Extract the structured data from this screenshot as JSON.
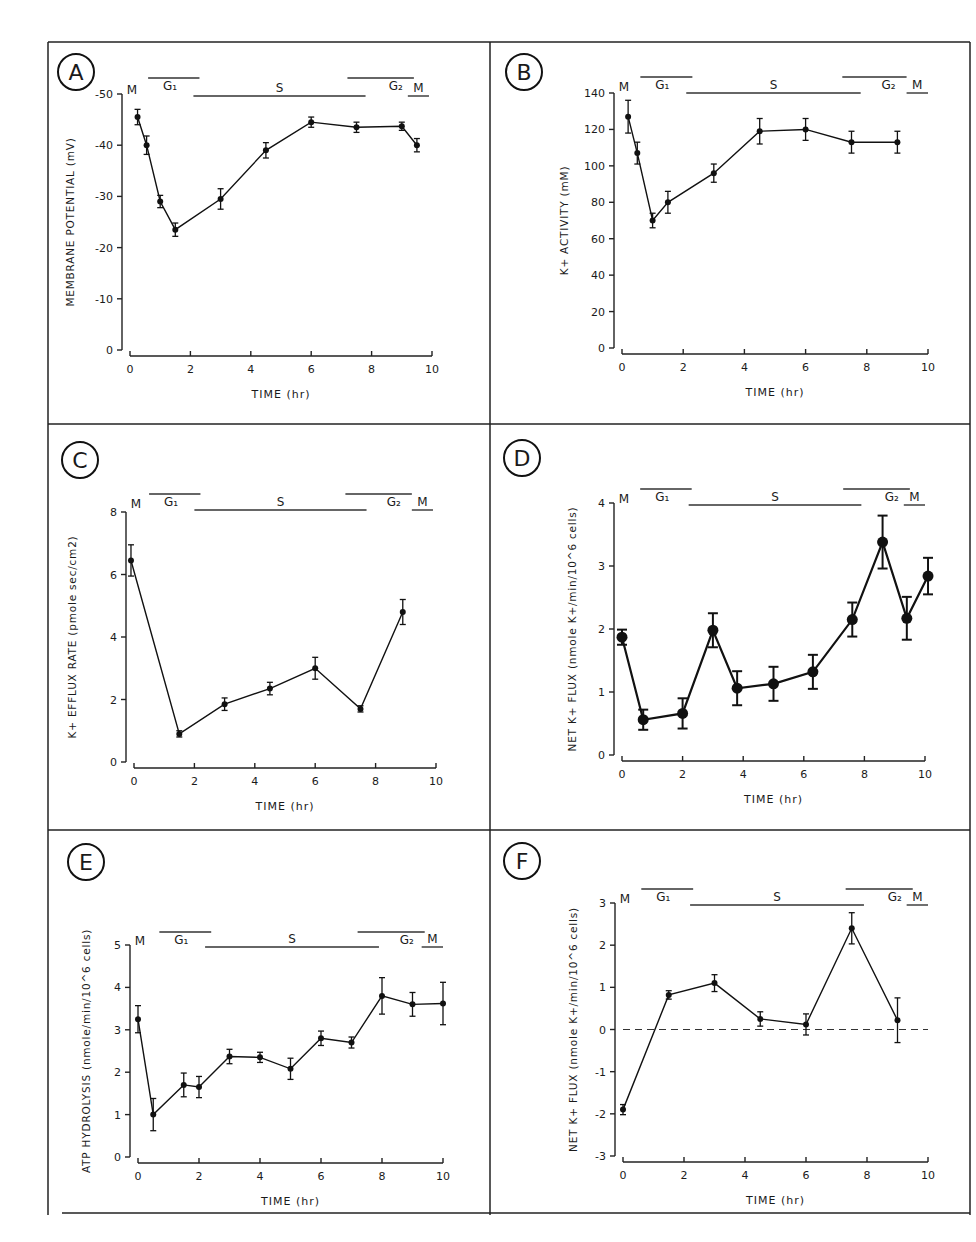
{
  "figure": {
    "panels_layout": "3 rows x 2 columns"
  },
  "chart_data": [
    {
      "panel": "A",
      "type": "line",
      "title": "",
      "xlabel": "TIME (hr)",
      "ylabel": "MEMBRANE POTENTIAL (mV)",
      "xlim": [
        0,
        10
      ],
      "ylim": [
        0,
        -50
      ],
      "x_ticks": [
        "0",
        "2",
        "4",
        "6",
        "8",
        "10"
      ],
      "y_ticks": [
        "0",
        "-10",
        "-20",
        "-30",
        "-40",
        "-50"
      ],
      "grid": false,
      "phases": [
        {
          "label": "M",
          "start": 0,
          "end": 0.3,
          "row": "low",
          "line": false
        },
        {
          "label": "G1",
          "start": 0.6,
          "end": 2.3,
          "row": "high",
          "line": true
        },
        {
          "label": "S",
          "start": 2.1,
          "end": 7.8,
          "row": "low",
          "line": true
        },
        {
          "label": "G2",
          "start": 7.2,
          "end": 9.4,
          "row": "high",
          "line": true
        },
        {
          "label": "M",
          "start": 9.2,
          "end": 9.9,
          "row": "low",
          "line": true
        }
      ],
      "series": [
        {
          "name": "membrane potential",
          "x": [
            0.25,
            0.55,
            1.0,
            1.5,
            3.0,
            4.5,
            6.0,
            7.5,
            9.0,
            9.5
          ],
          "y": [
            -45.5,
            -40,
            -29,
            -23.5,
            -29.5,
            -39,
            -44.5,
            -43.5,
            -43.7,
            -40
          ],
          "err": [
            1.5,
            1.8,
            1.2,
            1.3,
            2.0,
            1.5,
            1.0,
            1.0,
            0.8,
            1.3
          ]
        }
      ]
    },
    {
      "panel": "B",
      "type": "line",
      "title": "",
      "xlabel": "TIME (hr)",
      "ylabel": "K+ ACTIVITY (mM)",
      "xlim": [
        0,
        10
      ],
      "ylim": [
        0,
        140
      ],
      "x_ticks": [
        "0",
        "2",
        "4",
        "6",
        "8",
        "10"
      ],
      "y_ticks": [
        "0",
        "20",
        "40",
        "60",
        "80",
        "100",
        "120",
        "140"
      ],
      "grid": false,
      "phases": [
        {
          "label": "M",
          "start": 0,
          "end": 0.4,
          "row": "low",
          "line": false
        },
        {
          "label": "G1",
          "start": 0.6,
          "end": 2.3,
          "row": "high",
          "line": true
        },
        {
          "label": "S",
          "start": 2.1,
          "end": 7.8,
          "row": "low",
          "line": true
        },
        {
          "label": "G2",
          "start": 7.2,
          "end": 9.3,
          "row": "high",
          "line": true
        },
        {
          "label": "M",
          "start": 9.3,
          "end": 10.0,
          "row": "low",
          "line": true
        }
      ],
      "series": [
        {
          "name": "K+ activity",
          "x": [
            0.2,
            0.5,
            1.0,
            1.5,
            3.0,
            4.5,
            6.0,
            7.5,
            9.0
          ],
          "y": [
            127,
            107,
            70,
            80,
            96,
            119,
            120,
            113,
            113
          ],
          "err": [
            9,
            6,
            4,
            6,
            5,
            7,
            6,
            6,
            6
          ]
        }
      ]
    },
    {
      "panel": "C",
      "type": "line",
      "title": "",
      "xlabel": "TIME (hr)",
      "ylabel": "K+ EFFLUX RATE (pmole sec/cm2)",
      "xlim": [
        0,
        10
      ],
      "ylim": [
        0,
        8
      ],
      "x_ticks": [
        "0",
        "2",
        "4",
        "6",
        "8",
        "10"
      ],
      "y_ticks": [
        "0",
        "2",
        "4",
        "6",
        "8"
      ],
      "grid": false,
      "phases": [
        {
          "label": "M",
          "start": 0,
          "end": 0.1,
          "row": "low",
          "line": false
        },
        {
          "label": "G1",
          "start": 0.5,
          "end": 2.2,
          "row": "high",
          "line": true
        },
        {
          "label": "S",
          "start": 2.0,
          "end": 7.7,
          "row": "low",
          "line": true
        },
        {
          "label": "G2",
          "start": 7.0,
          "end": 9.2,
          "row": "high",
          "line": true
        },
        {
          "label": "M",
          "start": 9.2,
          "end": 9.9,
          "row": "low",
          "line": true
        }
      ],
      "series": [
        {
          "name": "K+ efflux rate",
          "x": [
            -0.1,
            1.5,
            3.0,
            4.5,
            6.0,
            7.5,
            8.9
          ],
          "y": [
            6.45,
            0.9,
            1.85,
            2.35,
            3.0,
            1.7,
            4.8
          ],
          "err": [
            0.5,
            0.1,
            0.2,
            0.2,
            0.35,
            0.1,
            0.4
          ]
        }
      ]
    },
    {
      "panel": "D",
      "type": "line",
      "title": "",
      "xlabel": "TIME (hr)",
      "ylabel": "NET K+ FLUX (nmole K+/min/10^6 cells)",
      "xlim": [
        0,
        10
      ],
      "ylim": [
        0,
        4
      ],
      "x_ticks": [
        "0",
        "2",
        "4",
        "6",
        "8",
        "10"
      ],
      "y_ticks": [
        "0",
        "1",
        "2",
        "3",
        "4"
      ],
      "grid": false,
      "phases": [
        {
          "label": "M",
          "start": 0,
          "end": 0.3,
          "row": "low",
          "line": false
        },
        {
          "label": "G1",
          "start": 0.6,
          "end": 2.3,
          "row": "high",
          "line": true
        },
        {
          "label": "S",
          "start": 2.2,
          "end": 7.9,
          "row": "low",
          "line": true
        },
        {
          "label": "G2",
          "start": 7.3,
          "end": 9.5,
          "row": "high",
          "line": true
        },
        {
          "label": "M",
          "start": 9.3,
          "end": 10.0,
          "row": "low",
          "line": true
        }
      ],
      "series": [
        {
          "name": "net K+ flux",
          "x": [
            0.0,
            0.7,
            2.0,
            3.0,
            3.8,
            5.0,
            6.3,
            7.6,
            8.6,
            9.4,
            10.1
          ],
          "y": [
            1.87,
            0.56,
            0.66,
            1.98,
            1.06,
            1.13,
            1.32,
            2.15,
            3.38,
            2.17,
            2.84
          ],
          "err": [
            0.12,
            0.16,
            0.24,
            0.27,
            0.27,
            0.27,
            0.27,
            0.27,
            0.42,
            0.34,
            0.29
          ]
        }
      ]
    },
    {
      "panel": "E",
      "type": "line",
      "title": "",
      "xlabel": "TIME (hr)",
      "ylabel": "ATP HYDROLYSIS (nmole/min/10^6 cells)",
      "xlim": [
        0,
        10
      ],
      "ylim": [
        0,
        5
      ],
      "x_ticks": [
        "0",
        "2",
        "4",
        "6",
        "8",
        "10"
      ],
      "y_ticks": [
        "0",
        "1",
        "2",
        "3",
        "4",
        "5"
      ],
      "grid": false,
      "phases": [
        {
          "label": "M",
          "start": 0,
          "end": 0.4,
          "row": "low",
          "line": false
        },
        {
          "label": "G1",
          "start": 0.7,
          "end": 2.4,
          "row": "high",
          "line": true
        },
        {
          "label": "S",
          "start": 2.2,
          "end": 7.9,
          "row": "low",
          "line": true
        },
        {
          "label": "G2",
          "start": 7.2,
          "end": 9.4,
          "row": "high",
          "line": true
        },
        {
          "label": "M",
          "start": 9.3,
          "end": 10.0,
          "row": "low",
          "line": true
        }
      ],
      "series": [
        {
          "name": "ATP hydrolysis",
          "x": [
            0.0,
            0.5,
            1.5,
            2.0,
            3.0,
            4.0,
            5.0,
            6.0,
            7.0,
            8.0,
            9.0,
            10.0
          ],
          "y": [
            3.25,
            1.0,
            1.7,
            1.65,
            2.37,
            2.35,
            2.08,
            2.8,
            2.7,
            3.8,
            3.6,
            3.62
          ],
          "err": [
            0.32,
            0.38,
            0.28,
            0.25,
            0.17,
            0.12,
            0.25,
            0.17,
            0.13,
            0.43,
            0.28,
            0.5
          ]
        }
      ]
    },
    {
      "panel": "F",
      "type": "line",
      "title": "",
      "xlabel": "TIME (hr)",
      "ylabel": "NET K+ FLUX (nmole K+/min/10^6 cells)",
      "xlim": [
        0,
        10
      ],
      "ylim": [
        -3,
        3
      ],
      "x_ticks": [
        "0",
        "2",
        "4",
        "6",
        "8",
        "10"
      ],
      "y_ticks": [
        "-3",
        "-2",
        "-1",
        "0",
        "1",
        "2",
        "3"
      ],
      "grid": false,
      "reference_line": {
        "y": 0,
        "style": "dashed"
      },
      "phases": [
        {
          "label": "M",
          "start": 0,
          "end": 0.4,
          "row": "low",
          "line": false
        },
        {
          "label": "G1",
          "start": 0.6,
          "end": 2.3,
          "row": "high",
          "line": true
        },
        {
          "label": "S",
          "start": 2.2,
          "end": 7.9,
          "row": "low",
          "line": true
        },
        {
          "label": "G2",
          "start": 7.3,
          "end": 9.5,
          "row": "high",
          "line": true
        },
        {
          "label": "M",
          "start": 9.3,
          "end": 10.0,
          "row": "low",
          "line": true
        }
      ],
      "series": [
        {
          "name": "net K+ flux",
          "x": [
            0.0,
            1.5,
            3.0,
            4.5,
            6.0,
            7.5,
            9.0
          ],
          "y": [
            -1.9,
            0.82,
            1.1,
            0.25,
            0.12,
            2.4,
            0.22
          ],
          "err": [
            0.12,
            0.1,
            0.2,
            0.17,
            0.25,
            0.37,
            0.53
          ]
        }
      ]
    }
  ]
}
